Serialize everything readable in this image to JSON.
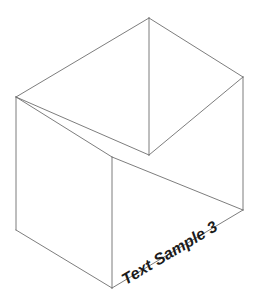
{
  "figure": {
    "width": 258,
    "height": 297,
    "background_color": "#ffffff",
    "line_color": "#6e6e6e",
    "line_width": 0.9,
    "text_color": "#1b1b1b"
  },
  "labels": {
    "edge_label": "Text Sample 3",
    "edge_label_rotation_deg": -30.8,
    "edge_label_font_size": 16,
    "edge_label_style": "bold italic"
  },
  "chart_data": {
    "type": "diagram",
    "subtype": "isometric-wireframe-box",
    "title": "",
    "xlabel": "",
    "ylabel": "",
    "annotations": [
      "Text Sample 3"
    ],
    "vertices": {
      "back_top_apex": [
        149,
        18
      ],
      "left_back_top": [
        16,
        97
      ],
      "right_back_top": [
        243,
        77
      ],
      "front_top_center": [
        149,
        155
      ],
      "front_left_top": [
        112,
        157
      ],
      "left_bottom": [
        16,
        230
      ],
      "front_bottom": [
        112,
        288
      ],
      "right_bottom": [
        243,
        210
      ]
    },
    "edges": [
      {
        "name": "top-back-left",
        "from": "left_back_top",
        "to": "back_top_apex"
      },
      {
        "name": "top-back-right",
        "from": "back_top_apex",
        "to": "right_back_top"
      },
      {
        "name": "top-front-left",
        "from": "left_back_top",
        "to": "front_top_center"
      },
      {
        "name": "top-front-right",
        "from": "front_top_center",
        "to": "right_back_top"
      },
      {
        "name": "vertical-back-center",
        "from": "back_top_apex",
        "to": "front_top_center"
      },
      {
        "name": "vertical-left",
        "from": "left_back_top",
        "to": "left_bottom"
      },
      {
        "name": "vertical-right",
        "from": "right_back_top",
        "to": "right_bottom"
      },
      {
        "name": "vertical-front-center",
        "from": "front_left_top",
        "to": "front_bottom"
      },
      {
        "name": "mid-left-slope",
        "from": "left_back_top",
        "to": "front_left_top"
      },
      {
        "name": "mid-right-slope",
        "from": "front_left_top",
        "to": "right_bottom"
      },
      {
        "name": "bottom-left",
        "from": "left_bottom",
        "to": "front_bottom"
      },
      {
        "name": "bottom-right",
        "from": "front_bottom",
        "to": "right_bottom"
      }
    ],
    "grid": false,
    "legend": null
  }
}
